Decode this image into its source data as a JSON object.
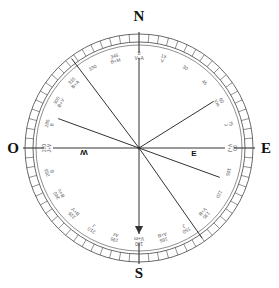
{
  "diagram": {
    "type": "compass-rose",
    "cardinals": {
      "north": "N",
      "south": "S",
      "east": "E",
      "west": "O"
    },
    "center": [
      139,
      148
    ],
    "outer_radius": 114,
    "inner_radius": 106,
    "tick_count": 72,
    "labels": [
      {
        "angle": 0,
        "text": "0\nV+A"
      },
      {
        "angle": 15,
        "text": "15\nV"
      },
      {
        "angle": 30,
        "text": "30"
      },
      {
        "angle": 45,
        "text": "45"
      },
      {
        "angle": 60,
        "text": "60\nVm"
      },
      {
        "angle": 75,
        "text": "75\nJ"
      },
      {
        "angle": 90,
        "text": "90\nV+J"
      },
      {
        "angle": 105,
        "text": "105"
      },
      {
        "angle": 120,
        "text": "120"
      },
      {
        "angle": 135,
        "text": "135\nV+B"
      },
      {
        "angle": 150,
        "text": "150\nJ"
      },
      {
        "angle": 165,
        "text": "165\nA+B"
      },
      {
        "angle": 180,
        "text": "180\nV+m"
      },
      {
        "angle": 195,
        "text": "195\nAz"
      },
      {
        "angle": 210,
        "text": "210\nJ"
      },
      {
        "angle": 225,
        "text": "225\nB+V"
      },
      {
        "angle": 240,
        "text": "240\nB+V"
      },
      {
        "angle": 255,
        "text": "255\nB"
      },
      {
        "angle": 270,
        "text": "270\nJ+V"
      },
      {
        "angle": 285,
        "text": "285\nB"
      },
      {
        "angle": 300,
        "text": "300\nB+V"
      },
      {
        "angle": 315,
        "text": "315\nB+A"
      },
      {
        "angle": 330,
        "text": "330"
      },
      {
        "angle": 345,
        "text": "345\nB+M"
      }
    ],
    "rays": [
      {
        "angle": 0,
        "length": 90,
        "arrow": false,
        "label": ""
      },
      {
        "angle": 58,
        "length": 88,
        "arrow": false,
        "label": ""
      },
      {
        "angle": 90,
        "length": 86,
        "arrow": false,
        "label": "E"
      },
      {
        "angle": 110,
        "length": 86,
        "arrow": false,
        "label": ""
      },
      {
        "angle": 145,
        "length": 110,
        "arrow": false,
        "label": ""
      },
      {
        "angle": 180,
        "length": 86,
        "arrow": true,
        "label": ""
      },
      {
        "angle": 270,
        "length": 86,
        "arrow": false,
        "label": "W"
      },
      {
        "angle": 290,
        "length": 86,
        "arrow": false,
        "label": ""
      },
      {
        "angle": 323,
        "length": 112,
        "arrow": false,
        "label": ""
      }
    ],
    "colors": {
      "line": "#333333",
      "ring": "#444444",
      "text": "#111111"
    }
  }
}
